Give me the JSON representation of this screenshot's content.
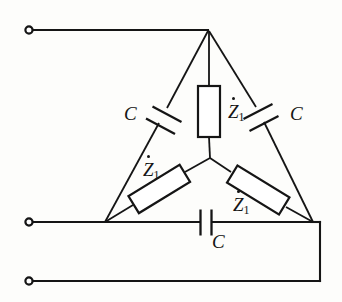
{
  "diagram": {
    "type": "electrical-circuit-schematic",
    "background_color": "#fdfdfb",
    "line_color": "#151515"
  },
  "terminals": [
    {
      "name": "terminal-top",
      "x": 29,
      "y": 30,
      "radius": 3.6
    },
    {
      "name": "terminal-middle",
      "x": 29,
      "y": 222,
      "radius": 3.6
    },
    {
      "name": "terminal-bottom",
      "x": 29,
      "y": 281,
      "radius": 3.6
    }
  ],
  "nodes": {
    "apex": {
      "x": 208,
      "y": 30
    },
    "left_vertex": {
      "x": 105,
      "y": 222
    },
    "right_vertex": {
      "x": 313,
      "y": 222
    },
    "center": {
      "x": 210,
      "y": 158
    }
  },
  "wires": [
    {
      "name": "lead-top",
      "from": [
        29,
        30
      ],
      "to": [
        208,
        30
      ]
    },
    {
      "name": "lead-middle",
      "from": [
        29,
        222
      ],
      "to": [
        105,
        222
      ]
    },
    {
      "name": "lead-bottom",
      "from": [
        29,
        281
      ],
      "to": [
        320,
        281
      ]
    },
    {
      "name": "right-drop",
      "from": [
        320,
        281
      ],
      "to": [
        320,
        222
      ]
    },
    {
      "name": "right-join",
      "from": [
        320,
        222
      ],
      "to": [
        313,
        222
      ]
    }
  ],
  "components": [
    {
      "name": "capacitor-left",
      "kind": "capacitor",
      "label": "C",
      "branch": "apex-to-left-vertex",
      "label_position": {
        "x": 124,
        "y": 104
      }
    },
    {
      "name": "capacitor-right",
      "kind": "capacitor",
      "label": "C",
      "branch": "apex-to-right-vertex",
      "label_position": {
        "x": 290,
        "y": 104
      }
    },
    {
      "name": "capacitor-bottom",
      "kind": "capacitor",
      "label": "C",
      "branch": "left-vertex-to-right-vertex",
      "label_position": {
        "x": 212,
        "y": 232
      }
    },
    {
      "name": "impedance-top",
      "kind": "impedance",
      "label": "Z",
      "subscript": "1",
      "branch": "apex-to-center",
      "label_position": {
        "x": 228,
        "y": 102
      }
    },
    {
      "name": "impedance-left",
      "kind": "impedance",
      "label": "Z",
      "subscript": "1",
      "branch": "center-to-left-vertex",
      "label_position": {
        "x": 143,
        "y": 160
      }
    },
    {
      "name": "impedance-right",
      "kind": "impedance",
      "label": "Z",
      "subscript": "1",
      "branch": "center-to-right-vertex",
      "label_position": {
        "x": 233,
        "y": 195
      }
    }
  ]
}
